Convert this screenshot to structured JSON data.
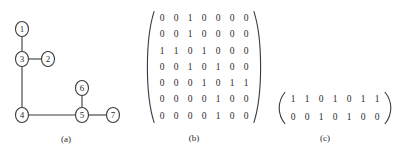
{
  "figure": {
    "panels": [
      {
        "id": "a",
        "caption": "(a)",
        "kind": "graph"
      },
      {
        "id": "b",
        "caption": "(b)",
        "kind": "matrix"
      },
      {
        "id": "c",
        "caption": "(c)",
        "kind": "matrix"
      }
    ]
  },
  "graph": {
    "caption": "(a)",
    "nodes": [
      {
        "id": "1",
        "label": "1",
        "x": 22,
        "y": 29
      },
      {
        "id": "2",
        "label": "2",
        "x": 48,
        "y": 59
      },
      {
        "id": "3",
        "label": "3",
        "x": 22,
        "y": 59
      },
      {
        "id": "4",
        "label": "4",
        "x": 22,
        "y": 115
      },
      {
        "id": "5",
        "label": "5",
        "x": 82,
        "y": 115
      },
      {
        "id": "6",
        "label": "6",
        "x": 82,
        "y": 88
      },
      {
        "id": "7",
        "label": "7",
        "x": 113,
        "y": 115
      }
    ],
    "edges": [
      {
        "from": "1",
        "to": "3"
      },
      {
        "from": "3",
        "to": "2"
      },
      {
        "from": "3",
        "to": "4"
      },
      {
        "from": "4",
        "to": "5"
      },
      {
        "from": "5",
        "to": "6"
      },
      {
        "from": "5",
        "to": "7"
      }
    ],
    "node_radius_x": 6.5,
    "node_radius_y": 7.5,
    "stroke_color": "#3a3a3a"
  },
  "matrix_b": {
    "caption": "(b)",
    "rows": 7,
    "cols": 7,
    "values": [
      [
        "0",
        "0",
        "1",
        "0",
        "0",
        "0",
        "0"
      ],
      [
        "0",
        "0",
        "1",
        "0",
        "0",
        "0",
        "0"
      ],
      [
        "1",
        "1",
        "0",
        "1",
        "0",
        "0",
        "0"
      ],
      [
        "0",
        "0",
        "1",
        "0",
        "1",
        "0",
        "0"
      ],
      [
        "0",
        "0",
        "0",
        "1",
        "0",
        "1",
        "1"
      ],
      [
        "0",
        "0",
        "0",
        "0",
        "1",
        "0",
        "0"
      ],
      [
        "0",
        "0",
        "0",
        "0",
        "1",
        "0",
        "0"
      ]
    ]
  },
  "matrix_c": {
    "caption": "(c)",
    "rows": 2,
    "cols": 7,
    "values": [
      [
        "1",
        "1",
        "0",
        "1",
        "0",
        "1",
        "1"
      ],
      [
        "0",
        "0",
        "1",
        "0",
        "1",
        "0",
        "0"
      ]
    ]
  },
  "colors": {
    "background": "#ffffff",
    "ink": "#2b2b2b",
    "line": "#3a3a3a"
  }
}
